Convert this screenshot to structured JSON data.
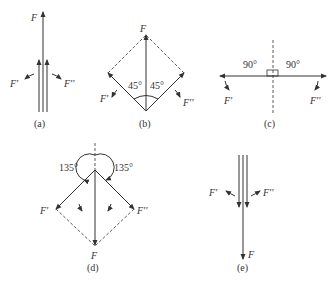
{
  "figure": {
    "panels": [
      {
        "id": "a",
        "caption": "(a)",
        "labels": {
          "F": "F",
          "F1": "F'",
          "F2": "F''"
        }
      },
      {
        "id": "b",
        "caption": "(b)",
        "labels": {
          "F": "F",
          "F1": "F'",
          "F2": "F''"
        },
        "angles": [
          "45°",
          "45°"
        ]
      },
      {
        "id": "c",
        "caption": "(c)",
        "labels": {
          "F1": "F'",
          "F2": "F''"
        },
        "angles": [
          "90°",
          "90°"
        ]
      },
      {
        "id": "d",
        "caption": "(d)",
        "labels": {
          "F": "F",
          "F1": "F'",
          "F2": "F''"
        },
        "angles": [
          "135°",
          "135°"
        ]
      },
      {
        "id": "e",
        "caption": "(e)",
        "labels": {
          "F": "F",
          "F1": "F'",
          "F2": "F''"
        }
      }
    ],
    "colors": {
      "line": "#333333",
      "background": "#ffffff"
    }
  }
}
